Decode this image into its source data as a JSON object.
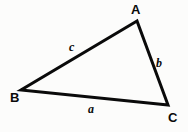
{
  "figure": {
    "kind": "geometry-diagram",
    "background_color": "#fcfcfb",
    "ink_color": "#0a0a0a",
    "width": 188,
    "height": 132
  },
  "triangle": {
    "vertices": [
      {
        "name": "A",
        "label": "A",
        "x": 137,
        "y": 21
      },
      {
        "name": "B",
        "label": "B",
        "x": 21,
        "y": 90
      },
      {
        "name": "C",
        "label": "C",
        "x": 168,
        "y": 105
      }
    ],
    "sides": [
      {
        "name": "a",
        "label": "a",
        "between": "B-C",
        "label_x": 91,
        "label_y": 109
      },
      {
        "name": "b",
        "label": "b",
        "between": "A-C",
        "label_x": 159,
        "label_y": 63
      },
      {
        "name": "c",
        "label": "c",
        "between": "A-B",
        "label_x": 72,
        "label_y": 47
      }
    ],
    "stroke_width": 3
  },
  "labels": {
    "vertex_A": "A",
    "vertex_B": "B",
    "vertex_C": "C",
    "side_a": "a",
    "side_b": "b",
    "side_c": "c"
  }
}
